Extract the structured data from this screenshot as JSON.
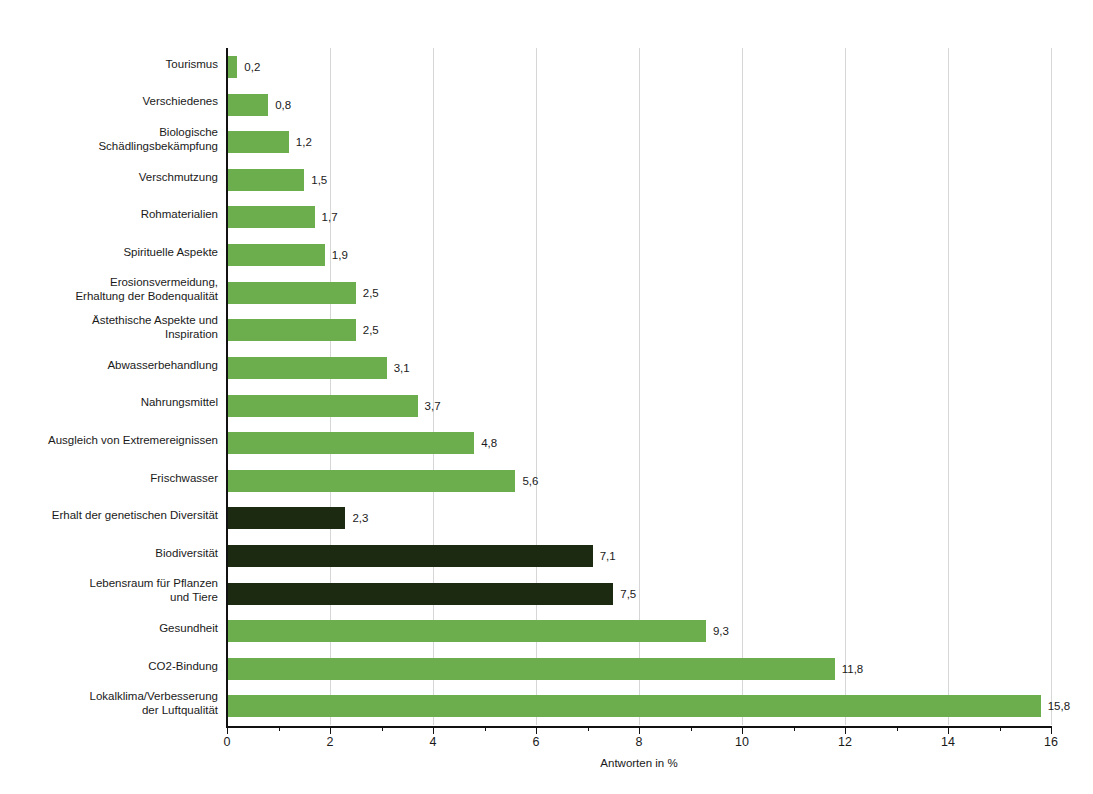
{
  "chart": {
    "type": "barh",
    "title": "",
    "xlabel": "Antworten in %",
    "ylabel": "",
    "xlim": [
      0,
      16
    ],
    "xticks": [
      0,
      2,
      4,
      6,
      8,
      10,
      12,
      14,
      16
    ],
    "xtick_labels": [
      "0",
      "2",
      "4",
      "6",
      "8",
      "10",
      "12",
      "14",
      "16"
    ],
    "grid": "vertical-major-only",
    "legend": "none",
    "decimal_separator": ",",
    "colors": {
      "green": "#6cae4d",
      "dark": "#1d2a12",
      "gridline": "#d6d6d6",
      "axis": "#111111",
      "text": "#1a1a1a",
      "background": "#ffffff"
    }
  },
  "chart_data": {
    "type": "bar",
    "orientation": "horizontal",
    "title": "",
    "xlabel": "Antworten in %",
    "ylabel": "",
    "xlim": [
      0,
      16
    ],
    "xticks": [
      0,
      2,
      4,
      6,
      8,
      10,
      12,
      14,
      16
    ],
    "grid": true,
    "legend_position": "none",
    "categories": [
      "Tourismus",
      "Verschiedenes",
      "Biologische\nSchädlingsbekämpfung",
      "Verschmutzung",
      "Rohmaterialien",
      "Spirituelle Aspekte",
      "Erosionsvermeidung,\nErhaltung der Bodenqualität",
      "Ästethische Aspekte und\nInspiration",
      "Abwasserbehandlung",
      "Nahrungsmittel",
      "Ausgleich von Extremereignissen",
      "Frischwasser",
      "Erhalt der genetischen Diversität",
      "Biodiversität",
      "Lebensraum für Pflanzen\nund Tiere",
      "Gesundheit",
      "CO2-Bindung",
      "Lokalklima/Verbesserung\nder Luftqualität"
    ],
    "values": [
      0.2,
      0.8,
      1.2,
      1.5,
      1.7,
      1.9,
      2.5,
      2.5,
      3.1,
      3.7,
      4.8,
      5.6,
      2.3,
      7.1,
      7.5,
      9.3,
      11.8,
      15.8
    ],
    "value_labels": [
      "0,2",
      "0,8",
      "1,2",
      "1,5",
      "1,7",
      "1,9",
      "2,5",
      "2,5",
      "3,1",
      "3,7",
      "4,8",
      "5,6",
      "2,3",
      "7,1",
      "7,5",
      "9,3",
      "11,8",
      "15,8"
    ],
    "series_group": [
      "green",
      "green",
      "green",
      "green",
      "green",
      "green",
      "green",
      "green",
      "green",
      "green",
      "green",
      "green",
      "dark",
      "dark",
      "dark",
      "green",
      "green",
      "green"
    ]
  }
}
